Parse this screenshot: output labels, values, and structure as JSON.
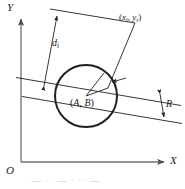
{
  "figure": {
    "type": "geometry-diagram",
    "axes": {
      "x_label": "X",
      "y_label": "Y",
      "origin_label": "O"
    },
    "labels": {
      "point_i": {
        "open": "(",
        "x_var": "x",
        "x_sub": "i",
        "comma": ", ",
        "y_var": "y",
        "y_sub": "i",
        "close": ")",
        "full": "(xi, yi)"
      },
      "distance": {
        "var": "d",
        "sub": "i",
        "full": "di"
      },
      "center": {
        "open": "(",
        "a": "A",
        "comma": ", ",
        "b": "B",
        "close": ")",
        "full": "(A, B)"
      },
      "radius": "R"
    },
    "colors": {
      "stroke": "#231f20",
      "axis": "#6b6b6b",
      "background": "#ffffff"
    },
    "geometry": {
      "circle": {
        "cx": 86,
        "cy": 96,
        "r": 31
      },
      "axis_x": {
        "x1": 21,
        "y1": 162,
        "x2": 166,
        "y2": 162
      },
      "axis_y": {
        "x1": 21,
        "y1": 162,
        "x2": 21,
        "y2": 17
      },
      "chord_line": {
        "x1": 16,
        "y1": 78,
        "x2": 181,
        "y2": 106
      },
      "tangent_line": {
        "x1": 22,
        "y1": 97,
        "x2": 182,
        "y2": 124
      },
      "dimension_di": {
        "x1": 44,
        "y1": 93,
        "x2": 57,
        "y2": 12
      },
      "point_connector": {
        "x1": 86,
        "y1": 96,
        "x2": 120,
        "y2": 33
      }
    },
    "caption_fragment": "· — ·· — · ·· —"
  }
}
